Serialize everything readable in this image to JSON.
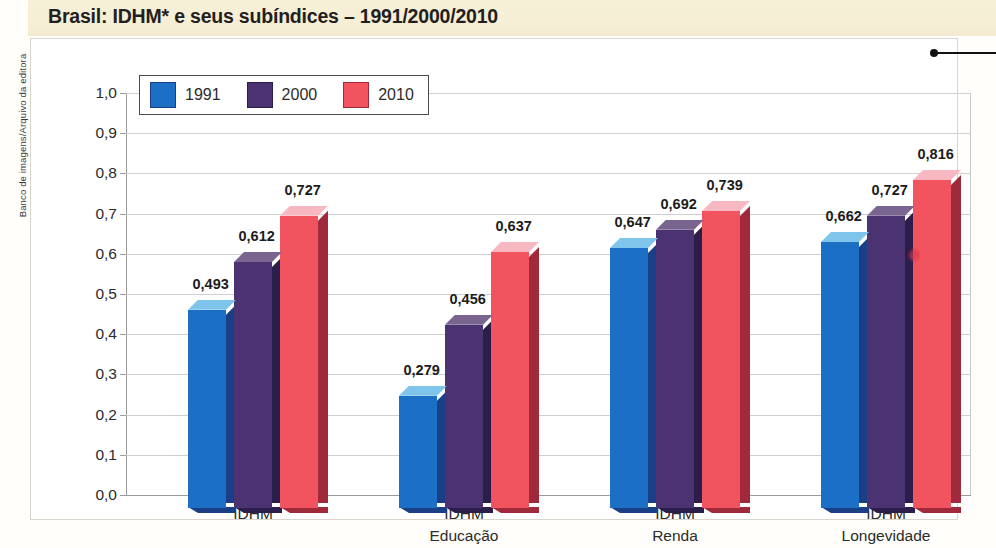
{
  "title": "Brasil: IDHM* e seus subíndices – 1991/2000/2010",
  "credit": "Banco de imagens/Arquivo da editora",
  "footnote": "",
  "legend": {
    "items": [
      {
        "label": "1991",
        "color": "#1b6fc4"
      },
      {
        "label": "2000",
        "color": "#4a3370"
      },
      {
        "label": "2010",
        "color": "#f2545f"
      }
    ]
  },
  "colors": {
    "series_1991_face": "#1b6fc4",
    "series_1991_top": "#7fc4ea",
    "series_1991_side": "#1a3f86",
    "series_2000_face": "#4a3370",
    "series_2000_top": "#7a6490",
    "series_2000_side": "#2b1e4a",
    "series_2010_face": "#f2545f",
    "series_2010_top": "#f7b8c2",
    "series_2010_side": "#a02a3c",
    "title_band": "#f6efd6",
    "axis": "#9a9a9a",
    "grid": "#cfcfcf"
  },
  "chart_data": {
    "type": "bar",
    "title": "Brasil: IDHM* e seus subíndices – 1991/2000/2010",
    "xlabel": "",
    "ylabel": "",
    "ylim": [
      0,
      1.0
    ],
    "ytick_labels": [
      "1,0",
      "0,9",
      "0,8",
      "0,7",
      "0,6",
      "0,5",
      "0,4",
      "0,3",
      "0,2",
      "0,1",
      "0,0"
    ],
    "ytick_values": [
      1.0,
      0.9,
      0.8,
      0.7,
      0.6,
      0.5,
      0.4,
      0.3,
      0.2,
      0.1,
      0.0
    ],
    "grid": true,
    "legend_position": "top-left inside",
    "categories": [
      "IDHM",
      "IDHM Educação",
      "IDHM Renda",
      "IDHM Longevidade"
    ],
    "category_lines": [
      [
        "IDHM"
      ],
      [
        "IDHM",
        "Educação"
      ],
      [
        "IDHM",
        "Renda"
      ],
      [
        "IDHM",
        "Longevidade"
      ]
    ],
    "series": [
      {
        "name": "1991",
        "color": "#1b6fc4",
        "values": [
          0.493,
          0.279,
          0.647,
          0.662
        ],
        "labels": [
          "0,493",
          "0,279",
          "0,647",
          "0,662"
        ]
      },
      {
        "name": "2000",
        "color": "#4a3370",
        "values": [
          0.612,
          0.456,
          0.692,
          0.727
        ],
        "labels": [
          "0,612",
          "0,456",
          "0,692",
          "0,727"
        ]
      },
      {
        "name": "2010",
        "color": "#f2545f",
        "values": [
          0.727,
          0.637,
          0.739,
          0.816
        ],
        "labels": [
          "0,727",
          "0,637",
          "0,739",
          "0,816"
        ]
      }
    ]
  }
}
